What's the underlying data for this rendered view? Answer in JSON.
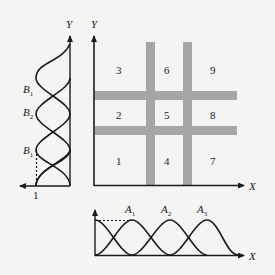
{
  "diagram": {
    "main_axes": {
      "x_label": "X",
      "y_label": "Y"
    },
    "grid_cells": [
      {
        "id": "1",
        "label": "1"
      },
      {
        "id": "2",
        "label": "2"
      },
      {
        "id": "3",
        "label": "3"
      },
      {
        "id": "4",
        "label": "4"
      },
      {
        "id": "5",
        "label": "5"
      },
      {
        "id": "6",
        "label": "6"
      },
      {
        "id": "7",
        "label": "7"
      },
      {
        "id": "8",
        "label": "8"
      },
      {
        "id": "9",
        "label": "9"
      }
    ],
    "left_plot": {
      "y_label": "Y",
      "amplitude_label": "1",
      "curve_labels": [
        {
          "base": "B",
          "sub": "1"
        },
        {
          "base": "B",
          "sub": "2"
        },
        {
          "base": "B",
          "sub": "1"
        }
      ]
    },
    "bottom_plot": {
      "x_label": "X",
      "curve_labels": [
        {
          "base": "A",
          "sub": "1"
        },
        {
          "base": "A",
          "sub": "2"
        },
        {
          "base": "A",
          "sub": "3"
        }
      ]
    },
    "colors": {
      "bar": "#a6a6a6",
      "line": "#1a1a1a",
      "background": "#f4f4f2"
    }
  }
}
